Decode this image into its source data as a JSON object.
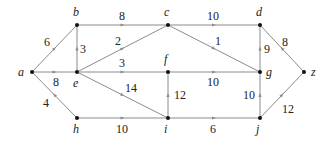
{
  "diagram": {
    "type": "directed weighted graph",
    "nodes": [
      {
        "id": "a",
        "x": 32,
        "y": 72,
        "lx": 18,
        "ly": 76
      },
      {
        "id": "b",
        "x": 77,
        "y": 25,
        "lx": 73,
        "ly": 16
      },
      {
        "id": "c",
        "x": 168,
        "y": 25,
        "lx": 164,
        "ly": 16
      },
      {
        "id": "d",
        "x": 260,
        "y": 25,
        "lx": 256,
        "ly": 16
      },
      {
        "id": "e",
        "x": 77,
        "y": 72,
        "lx": 73,
        "ly": 87
      },
      {
        "id": "f",
        "x": 168,
        "y": 72,
        "lx": 164,
        "ly": 63
      },
      {
        "id": "g",
        "x": 260,
        "y": 72,
        "lx": 266,
        "ly": 76
      },
      {
        "id": "h",
        "x": 77,
        "y": 118,
        "lx": 73,
        "ly": 133
      },
      {
        "id": "i",
        "x": 168,
        "y": 118,
        "lx": 164,
        "ly": 133
      },
      {
        "id": "j",
        "x": 260,
        "y": 118,
        "lx": 256,
        "ly": 133
      },
      {
        "id": "z",
        "x": 304,
        "y": 72,
        "lx": 311,
        "ly": 76
      }
    ],
    "edges": [
      {
        "from": "a",
        "to": "b",
        "weight": "6",
        "wx": 44,
        "wy": 46
      },
      {
        "from": "a",
        "to": "e",
        "weight": "8",
        "wx": 53,
        "wy": 86
      },
      {
        "from": "h",
        "to": "a",
        "weight": "4",
        "wx": 43,
        "wy": 107
      },
      {
        "from": "b",
        "to": "c",
        "weight": "8",
        "wx": 119,
        "wy": 20
      },
      {
        "from": "e",
        "to": "b",
        "weight": "3",
        "wx": 80,
        "wy": 53
      },
      {
        "from": "e",
        "to": "c",
        "weight": "2",
        "wx": 115,
        "wy": 45
      },
      {
        "from": "e",
        "to": "f",
        "weight": "3",
        "wx": 119,
        "wy": 67
      },
      {
        "from": "e",
        "to": "i",
        "weight": "14",
        "wx": 125,
        "wy": 92
      },
      {
        "from": "h",
        "to": "i",
        "weight": "10",
        "wx": 116,
        "wy": 133
      },
      {
        "from": "c",
        "to": "d",
        "weight": "10",
        "wx": 207,
        "wy": 20
      },
      {
        "from": "c",
        "to": "g",
        "weight": "1",
        "wx": 215,
        "wy": 45
      },
      {
        "from": "f",
        "to": "g",
        "weight": "10",
        "wx": 207,
        "wy": 86
      },
      {
        "from": "i",
        "to": "f",
        "weight": "12",
        "wx": 174,
        "wy": 99
      },
      {
        "from": "g",
        "to": "d",
        "weight": "9",
        "wx": 264,
        "wy": 53
      },
      {
        "from": "j",
        "to": "g",
        "weight": "10",
        "wx": 243,
        "wy": 99
      },
      {
        "from": "i",
        "to": "j",
        "weight": "6",
        "wx": 210,
        "wy": 133
      },
      {
        "from": "z",
        "to": "d",
        "weight": "8",
        "wx": 282,
        "wy": 46
      },
      {
        "from": "j",
        "to": "z",
        "weight": "12",
        "wx": 282,
        "wy": 113
      }
    ]
  }
}
